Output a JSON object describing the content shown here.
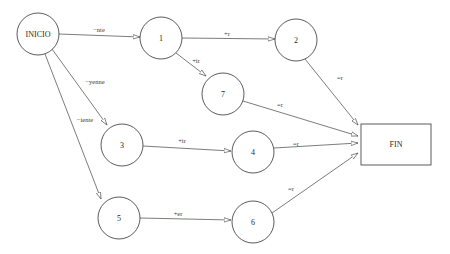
{
  "diagram": {
    "type": "state-transition-diagram",
    "colors": {
      "background": "#ffffff",
      "stroke": "#4a4a4a",
      "text": "#2a2a2a"
    },
    "nodes": [
      {
        "id": "INICIO",
        "label": "INICIO",
        "shape": "circle",
        "cx": 38,
        "cy": 34,
        "r": 21
      },
      {
        "id": "1",
        "label": "1",
        "shape": "circle",
        "cx": 161,
        "cy": 38,
        "r": 21
      },
      {
        "id": "2",
        "label": "2",
        "shape": "circle",
        "cx": 296,
        "cy": 40,
        "r": 21
      },
      {
        "id": "7",
        "label": "7",
        "shape": "circle",
        "cx": 223,
        "cy": 94,
        "r": 21
      },
      {
        "id": "3",
        "label": "3",
        "shape": "circle",
        "cx": 122,
        "cy": 145,
        "r": 21
      },
      {
        "id": "4",
        "label": "4",
        "shape": "circle",
        "cx": 253,
        "cy": 152,
        "r": 21
      },
      {
        "id": "5",
        "label": "5",
        "shape": "circle",
        "cx": 119,
        "cy": 218,
        "r": 21
      },
      {
        "id": "6",
        "label": "6",
        "shape": "circle",
        "cx": 253,
        "cy": 222,
        "r": 21
      },
      {
        "id": "FIN",
        "label": "FIN",
        "shape": "rect",
        "x": 361,
        "y": 124,
        "w": 70,
        "h": 41
      }
    ],
    "edges": [
      {
        "from": "INICIO",
        "to": "1",
        "label": "−nte",
        "x1": 59,
        "y1": 34,
        "x2": 140,
        "y2": 37,
        "lx": 99,
        "ly": 29
      },
      {
        "from": "INICIO",
        "to": "3",
        "label": "−yenne",
        "x1": 52,
        "y1": 49,
        "x2": 107,
        "y2": 125,
        "lx": 95,
        "ly": 81
      },
      {
        "from": "INICIO",
        "to": "5",
        "label": "−iente",
        "x1": 45,
        "y1": 54,
        "x2": 101,
        "y2": 199,
        "lx": 85,
        "ly": 119
      },
      {
        "from": "1",
        "to": "2",
        "label": "+r",
        "x1": 182,
        "y1": 38,
        "x2": 275,
        "y2": 39,
        "lx": 227,
        "ly": 33
      },
      {
        "from": "1",
        "to": "7",
        "label": "+ir",
        "x1": 176,
        "y1": 53,
        "x2": 206,
        "y2": 76,
        "lx": 196,
        "ly": 60
      },
      {
        "from": "2",
        "to": "FIN",
        "label": "=r",
        "x1": 305,
        "y1": 59,
        "x2": 358,
        "y2": 125,
        "lx": 340,
        "ly": 77
      },
      {
        "from": "7",
        "to": "FIN",
        "label": "=r",
        "x1": 243,
        "y1": 101,
        "x2": 358,
        "y2": 136,
        "lx": 280,
        "ly": 104
      },
      {
        "from": "3",
        "to": "4",
        "label": "+ir",
        "x1": 143,
        "y1": 146,
        "x2": 231,
        "y2": 151,
        "lx": 182,
        "ly": 140
      },
      {
        "from": "4",
        "to": "FIN",
        "label": "=r",
        "x1": 274,
        "y1": 148,
        "x2": 358,
        "y2": 143,
        "lx": 296,
        "ly": 143
      },
      {
        "from": "5",
        "to": "6",
        "label": "+er",
        "x1": 140,
        "y1": 218,
        "x2": 231,
        "y2": 220,
        "lx": 178,
        "ly": 213
      },
      {
        "from": "6",
        "to": "FIN",
        "label": "=r",
        "x1": 272,
        "y1": 213,
        "x2": 358,
        "y2": 153,
        "lx": 291,
        "ly": 188
      }
    ]
  }
}
